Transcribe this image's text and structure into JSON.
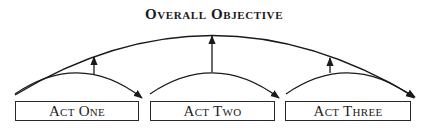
{
  "title": "Overall Objective",
  "acts": [
    {
      "label": "Act One"
    },
    {
      "label": "Act Two"
    },
    {
      "label": "Act Three"
    }
  ],
  "colors": {
    "line": "#1a1a1a",
    "text": "#222222",
    "background": "#ffffff"
  }
}
